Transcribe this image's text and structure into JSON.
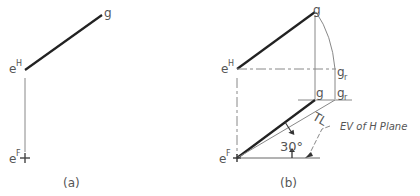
{
  "panel_a": {
    "caption": "(a)",
    "label_g": "g",
    "label_e_top": "e",
    "label_e_top_sup": "H",
    "label_e_bottom": "e",
    "label_e_bottom_sup": "F"
  },
  "panel_b": {
    "caption": "(b)",
    "label_g_top": "g",
    "label_e_top": "e",
    "label_e_top_sup": "H",
    "label_gr_mid": "g",
    "label_gr_mid_sub": "r",
    "label_g_low": "g",
    "label_gr_low": "g",
    "label_gr_low_sub": "r",
    "label_tl": "TL",
    "label_angle": "30°",
    "label_e_bottom": "e",
    "label_e_bottom_sup": "F",
    "annotation": "EV of H Plane"
  }
}
